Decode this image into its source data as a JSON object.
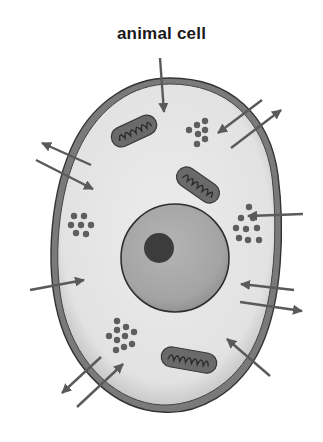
{
  "title": "animal cell",
  "colors": {
    "background": "#ffffff",
    "membrane_outer": "#3a3a3a",
    "membrane_band": "#7a7a7a",
    "cytoplasm": "#e6e6e6",
    "cytoplasm_edge": "#bdbdbd",
    "nucleus": "#a8a8a8",
    "nucleus_edge": "#2e2e2e",
    "nucleolus": "#3a3a3a",
    "mitochondrion": "#6a6a6a",
    "granules": "#5e5e5e",
    "arrows": "#5a5a5a"
  },
  "parts": {
    "membrane": "cell membrane",
    "cytoplasm": "cytoplasm",
    "nucleus": "nucleus",
    "nucleolus": "nucleolus",
    "mitochondria_count": 3,
    "granule_clusters_count": 4,
    "arrow_count": 14
  }
}
